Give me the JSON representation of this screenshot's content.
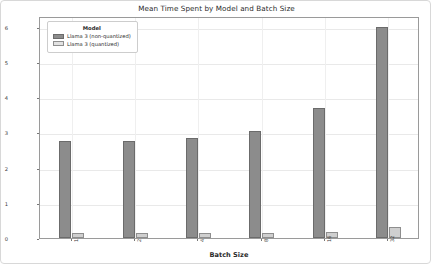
{
  "chart_data": {
    "type": "bar",
    "title": "Mean Time Spent by Model and Batch Size",
    "xlabel": "Batch Size",
    "ylabel": "Mean Time Spent (s)",
    "categories": [
      "1",
      "2",
      "4",
      "8",
      "16",
      "32"
    ],
    "series": [
      {
        "name": "Llama 3 (non-quantized)",
        "color": "#8c8c8c",
        "values": [
          2.75,
          2.75,
          2.85,
          3.05,
          3.7,
          6.0
        ]
      },
      {
        "name": "Llama 3 (quantized)",
        "color": "#cfcfcf",
        "values": [
          0.13,
          0.13,
          0.14,
          0.13,
          0.18,
          0.3
        ]
      }
    ],
    "ylim": [
      0,
      6.3
    ],
    "yticks": [
      "0",
      "1",
      "2",
      "3",
      "4",
      "5",
      "6"
    ],
    "ytick_values": [
      0,
      1,
      2,
      3,
      4,
      5,
      6
    ],
    "grid": true,
    "legend_position": "upper left",
    "legend_title": "Model"
  }
}
